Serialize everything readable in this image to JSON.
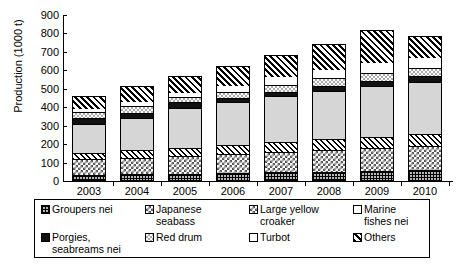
{
  "chart_data": {
    "type": "bar",
    "subtype": "stacked-bar",
    "title": "",
    "xlabel": "",
    "ylabel": "Production (1000 t)",
    "ylim": [
      0,
      900
    ],
    "ytick_step": 100,
    "yticks": [
      900,
      800,
      700,
      600,
      500,
      400,
      300,
      200,
      100,
      0
    ],
    "grid": false,
    "legend_position": "bottom",
    "categories": [
      "2003",
      "2004",
      "2005",
      "2006",
      "2007",
      "2008",
      "2009",
      "2010"
    ],
    "series": [
      {
        "name": "Groupers nei",
        "pattern": "fine-grid",
        "values": [
          28,
          30,
          34,
          38,
          42,
          46,
          50,
          54
        ]
      },
      {
        "name": "Japanese seabass",
        "pattern": "checkerboard",
        "values": [
          84,
          92,
          97,
          105,
          112,
          118,
          124,
          130
        ]
      },
      {
        "name": "Large yellow croaker",
        "pattern": "diagonal-hatch",
        "values": [
          37,
          40,
          42,
          47,
          52,
          56,
          60,
          64
        ]
      },
      {
        "name": "Marine fishes nei",
        "pattern": "light-gray-solid",
        "values": [
          155,
          172,
          215,
          232,
          248,
          263,
          277,
          285
        ]
      },
      {
        "name": "Porgies, seabreams nei",
        "pattern": "solid-black",
        "values": [
          30,
          32,
          35,
          25,
          26,
          27,
          28,
          29
        ]
      },
      {
        "name": "Red drum",
        "pattern": "light-dots",
        "values": [
          33,
          36,
          27,
          32,
          38,
          41,
          44,
          46
        ]
      },
      {
        "name": "Turbot",
        "pattern": "white",
        "values": [
          22,
          24,
          30,
          36,
          44,
          50,
          56,
          60
        ]
      },
      {
        "name": "Others",
        "pattern": "dark-diagonal",
        "values": [
          66,
          84,
          82,
          105,
          118,
          139,
          176,
          112
        ]
      }
    ],
    "totals": [
      455,
      510,
      562,
      620,
      680,
      740,
      815,
      780
    ],
    "units": "1000 t"
  },
  "legend": {
    "items": [
      {
        "label": "Groupers nei",
        "pattern_class": "p-grid"
      },
      {
        "label": "Japanese\nseabass",
        "pattern_class": "p-check"
      },
      {
        "label": "Large yellow\ncroaker",
        "pattern_class": "p-check"
      },
      {
        "label": "Marine\nfishes nei",
        "pattern_class": "p-white"
      },
      {
        "label": "Porgies,\nseabreams nei",
        "pattern_class": "p-black"
      },
      {
        "label": "Red drum",
        "pattern_class": "p-dots"
      },
      {
        "label": "Turbot",
        "pattern_class": "p-white"
      },
      {
        "label": "Others",
        "pattern_class": "p-diag2"
      }
    ]
  },
  "colors": {
    "axis": "#000000",
    "background": "#ffffff",
    "gray_fill": "#d6d6d6",
    "black_fill": "#111111"
  }
}
